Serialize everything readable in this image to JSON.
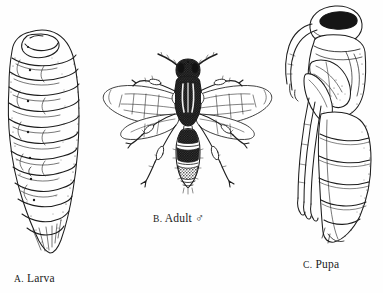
{
  "plate": {
    "background_color": "#fefefe",
    "ink_color": "#1d1d1d",
    "width": 383,
    "height": 293,
    "kind": "scientific-illustration-plate",
    "subject": "wasp life stages"
  },
  "captions": {
    "larva": {
      "index": "A.",
      "name": "Larva"
    },
    "adult": {
      "index": "B.",
      "name": "Adult",
      "sex_symbol": "♂"
    },
    "pupa": {
      "index": "C.",
      "name": "Pupa"
    }
  },
  "figures": {
    "larva": {
      "label": "larva-figure",
      "description": "segmented legless grub, curled head at top, tapering tail",
      "segment_count": 12,
      "spiracle_count": 7,
      "orientation": "vertical"
    },
    "adult": {
      "label": "adult-figure",
      "description": "dorsal view winged wasp",
      "wing_count": 4,
      "leg_count": 6,
      "antenna_count": 2,
      "abdomen_band_count": 5,
      "orientation": "dorsal"
    },
    "pupa": {
      "label": "pupa-figure",
      "description": "lateral view exarate pupa with free appendages",
      "abdomen_segment_count": 6,
      "orientation": "lateral"
    }
  }
}
